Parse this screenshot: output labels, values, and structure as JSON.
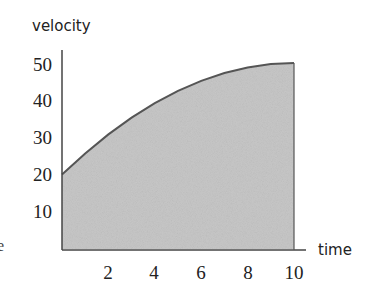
{
  "chart_data": {
    "type": "area",
    "title": "",
    "xlabel": "time",
    "ylabel": "velocity",
    "x": [
      0,
      1,
      2,
      3,
      4,
      5,
      6,
      7,
      8,
      9,
      10
    ],
    "series": [
      {
        "name": "velocity",
        "values": [
          20,
          25.7,
          30.8,
          35.3,
          39.2,
          42.5,
          45.2,
          47.3,
          48.8,
          49.7,
          50
        ]
      }
    ],
    "xticks": [
      2,
      4,
      6,
      8,
      10
    ],
    "yticks": [
      10,
      20,
      30,
      40,
      50
    ],
    "xlim": [
      0,
      10.5
    ],
    "ylim": [
      0,
      52
    ],
    "grid": false,
    "legend": null,
    "fill_color": "#c8c8c8",
    "line_color": "#555555",
    "axis_color": "#444444"
  },
  "labels": {
    "y_axis": "velocity",
    "x_axis": "time",
    "edge_fragment": "e"
  },
  "yticks": [
    "50",
    "40",
    "30",
    "20",
    "10"
  ],
  "xticks": [
    "2",
    "4",
    "6",
    "8",
    "10"
  ]
}
